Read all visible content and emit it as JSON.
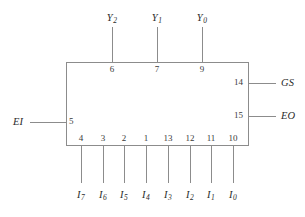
{
  "diagram": {
    "type": "logic-block-diagram",
    "component": "priority-encoder",
    "box": {
      "x": 66,
      "y": 62,
      "width": 182,
      "height": 83
    },
    "line_color": "#8c8c8c",
    "text_color": "#2b2b2b",
    "background": "#ffffff"
  },
  "outputs_top": [
    {
      "name": "Y",
      "sub": "2",
      "pin": "6",
      "x": 112
    },
    {
      "name": "Y",
      "sub": "1",
      "pin": "7",
      "x": 157
    },
    {
      "name": "Y",
      "sub": "0",
      "pin": "9",
      "x": 202
    }
  ],
  "outputs_right": [
    {
      "name": "GS",
      "sub": "",
      "pin": "14",
      "y": 83
    },
    {
      "name": "EO",
      "sub": "",
      "pin": "15",
      "y": 116
    }
  ],
  "input_left": {
    "name": "EI",
    "sub": "",
    "pin": "5",
    "y": 122
  },
  "inputs_bottom": [
    {
      "name": "I",
      "sub": "7",
      "pin": "4",
      "x": 81
    },
    {
      "name": "I",
      "sub": "6",
      "pin": "3",
      "x": 103
    },
    {
      "name": "I",
      "sub": "5",
      "pin": "2",
      "x": 124
    },
    {
      "name": "I",
      "sub": "4",
      "pin": "1",
      "x": 146
    },
    {
      "name": "I",
      "sub": "3",
      "pin": "13",
      "x": 168
    },
    {
      "name": "I",
      "sub": "2",
      "pin": "12",
      "x": 190
    },
    {
      "name": "I",
      "sub": "1",
      "pin": "11",
      "x": 211
    },
    {
      "name": "I",
      "sub": "0",
      "pin": "10",
      "x": 233
    }
  ]
}
